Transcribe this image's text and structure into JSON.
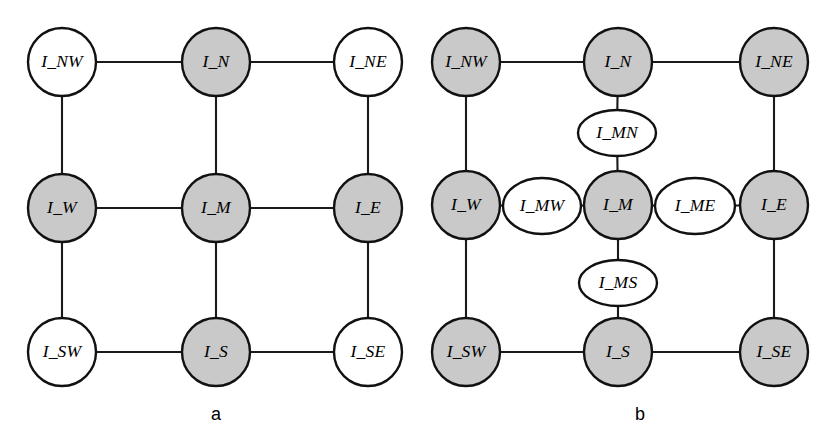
{
  "figure": {
    "width": 834,
    "height": 447,
    "background_color": "#ffffff",
    "stroke_color": "#111111",
    "filled_node_color": "#c9c9c9",
    "hollow_node_color": "#ffffff"
  },
  "panels": [
    {
      "id": "panel-a",
      "caption": "a",
      "caption_position": {
        "x": 216,
        "y": 415
      },
      "nodes": [
        {
          "id": "a_I_NW",
          "label": "I_NW",
          "shape": "circle",
          "fill": "hollow",
          "cx": 62,
          "cy": 62,
          "rx": 34,
          "ry": 34
        },
        {
          "id": "a_I_N",
          "label": "I_N",
          "shape": "circle",
          "fill": "filled",
          "cx": 216,
          "cy": 62,
          "rx": 34,
          "ry": 34
        },
        {
          "id": "a_I_NE",
          "label": "I_NE",
          "shape": "circle",
          "fill": "hollow",
          "cx": 368,
          "cy": 62,
          "rx": 34,
          "ry": 34
        },
        {
          "id": "a_I_W",
          "label": "I_W",
          "shape": "circle",
          "fill": "filled",
          "cx": 62,
          "cy": 208,
          "rx": 34,
          "ry": 34
        },
        {
          "id": "a_I_M",
          "label": "I_M",
          "shape": "circle",
          "fill": "filled",
          "cx": 216,
          "cy": 208,
          "rx": 34,
          "ry": 34
        },
        {
          "id": "a_I_E",
          "label": "I_E",
          "shape": "circle",
          "fill": "filled",
          "cx": 368,
          "cy": 208,
          "rx": 34,
          "ry": 34
        },
        {
          "id": "a_I_SW",
          "label": "I_SW",
          "shape": "circle",
          "fill": "hollow",
          "cx": 62,
          "cy": 352,
          "rx": 34,
          "ry": 34
        },
        {
          "id": "a_I_S",
          "label": "I_S",
          "shape": "circle",
          "fill": "filled",
          "cx": 216,
          "cy": 352,
          "rx": 34,
          "ry": 34
        },
        {
          "id": "a_I_SE",
          "label": "I_SE",
          "shape": "circle",
          "fill": "hollow",
          "cx": 368,
          "cy": 352,
          "rx": 34,
          "ry": 34
        }
      ],
      "edges": [
        {
          "from": "a_I_NW",
          "to": "a_I_N"
        },
        {
          "from": "a_I_N",
          "to": "a_I_NE"
        },
        {
          "from": "a_I_W",
          "to": "a_I_M"
        },
        {
          "from": "a_I_M",
          "to": "a_I_E"
        },
        {
          "from": "a_I_SW",
          "to": "a_I_S"
        },
        {
          "from": "a_I_S",
          "to": "a_I_SE"
        },
        {
          "from": "a_I_NW",
          "to": "a_I_W"
        },
        {
          "from": "a_I_W",
          "to": "a_I_SW"
        },
        {
          "from": "a_I_N",
          "to": "a_I_M"
        },
        {
          "from": "a_I_M",
          "to": "a_I_S"
        },
        {
          "from": "a_I_NE",
          "to": "a_I_E"
        },
        {
          "from": "a_I_E",
          "to": "a_I_SE"
        }
      ]
    },
    {
      "id": "panel-b",
      "caption": "b",
      "caption_position": {
        "x": 640,
        "y": 415
      },
      "nodes": [
        {
          "id": "b_I_NW",
          "label": "I_NW",
          "shape": "circle",
          "fill": "filled",
          "cx": 466,
          "cy": 62,
          "rx": 34,
          "ry": 34
        },
        {
          "id": "b_I_N",
          "label": "I_N",
          "shape": "circle",
          "fill": "filled",
          "cx": 618,
          "cy": 62,
          "rx": 34,
          "ry": 34
        },
        {
          "id": "b_I_NE",
          "label": "I_NE",
          "shape": "circle",
          "fill": "filled",
          "cx": 774,
          "cy": 62,
          "rx": 34,
          "ry": 34
        },
        {
          "id": "b_I_MN",
          "label": "I_MN",
          "shape": "ellipse",
          "fill": "hollow",
          "cx": 617,
          "cy": 133,
          "rx": 39,
          "ry": 23
        },
        {
          "id": "b_I_W",
          "label": "I_W",
          "shape": "circle",
          "fill": "filled",
          "cx": 466,
          "cy": 205,
          "rx": 34,
          "ry": 34
        },
        {
          "id": "b_I_MW",
          "label": "I_MW",
          "shape": "ellipse",
          "fill": "hollow",
          "cx": 542,
          "cy": 206,
          "rx": 39,
          "ry": 28
        },
        {
          "id": "b_I_M",
          "label": "I_M",
          "shape": "circle",
          "fill": "filled",
          "cx": 618,
          "cy": 205,
          "rx": 34,
          "ry": 34
        },
        {
          "id": "b_I_ME",
          "label": "I_ME",
          "shape": "ellipse",
          "fill": "hollow",
          "cx": 695,
          "cy": 206,
          "rx": 40,
          "ry": 28
        },
        {
          "id": "b_I_E",
          "label": "I_E",
          "shape": "circle",
          "fill": "filled",
          "cx": 774,
          "cy": 205,
          "rx": 34,
          "ry": 34
        },
        {
          "id": "b_I_MS",
          "label": "I_MS",
          "shape": "ellipse",
          "fill": "hollow",
          "cx": 618,
          "cy": 283,
          "rx": 39,
          "ry": 23
        },
        {
          "id": "b_I_SW",
          "label": "I_SW",
          "shape": "circle",
          "fill": "filled",
          "cx": 466,
          "cy": 352,
          "rx": 34,
          "ry": 34
        },
        {
          "id": "b_I_S",
          "label": "I_S",
          "shape": "circle",
          "fill": "filled",
          "cx": 618,
          "cy": 352,
          "rx": 34,
          "ry": 34
        },
        {
          "id": "b_I_SE",
          "label": "I_SE",
          "shape": "circle",
          "fill": "filled",
          "cx": 774,
          "cy": 352,
          "rx": 34,
          "ry": 34
        }
      ],
      "edges": [
        {
          "from": "b_I_NW",
          "to": "b_I_N"
        },
        {
          "from": "b_I_N",
          "to": "b_I_NE"
        },
        {
          "from": "b_I_NW",
          "to": "b_I_W"
        },
        {
          "from": "b_I_W",
          "to": "b_I_SW"
        },
        {
          "from": "b_I_NE",
          "to": "b_I_E"
        },
        {
          "from": "b_I_E",
          "to": "b_I_SE"
        },
        {
          "from": "b_I_SW",
          "to": "b_I_S"
        },
        {
          "from": "b_I_S",
          "to": "b_I_SE"
        },
        {
          "from": "b_I_N",
          "to": "b_I_MN"
        },
        {
          "from": "b_I_MN",
          "to": "b_I_M"
        },
        {
          "from": "b_I_W",
          "to": "b_I_MW"
        },
        {
          "from": "b_I_MW",
          "to": "b_I_M"
        },
        {
          "from": "b_I_M",
          "to": "b_I_ME"
        },
        {
          "from": "b_I_ME",
          "to": "b_I_E"
        },
        {
          "from": "b_I_M",
          "to": "b_I_MS"
        },
        {
          "from": "b_I_MS",
          "to": "b_I_S"
        }
      ]
    }
  ]
}
